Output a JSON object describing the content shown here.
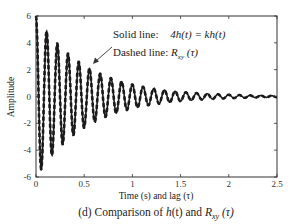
{
  "chart_data": {
    "type": "line",
    "title": "",
    "caption": "(d) Comparison of h(t) and R_xy(τ)",
    "caption_parts": {
      "prefix": "(d) Comparison of ",
      "h": "h",
      "t": "(t)",
      "and": " and ",
      "R": "R",
      "sub": "xy",
      "tau": " (τ)"
    },
    "xlabel": "Time (s) and  lag (τ)",
    "ylabel": "Amplitude",
    "xlim": [
      0,
      2.5
    ],
    "ylim": [
      -6,
      6
    ],
    "xticks": [
      0,
      0.5,
      1,
      1.5,
      2,
      2.5
    ],
    "xtick_labels": [
      "0",
      "0.5",
      "1",
      "1.5",
      "2",
      "2.5"
    ],
    "yticks": [
      -6,
      -4,
      -2,
      0,
      2,
      4,
      6
    ],
    "ytick_labels": [
      "-6",
      "-4",
      "-2",
      "0",
      "2",
      "4",
      "6"
    ],
    "grid": false,
    "annotations": {
      "solid_prefix": "Solid line:",
      "solid_eq": "4h(t) = kh(t)",
      "dashed_prefix": "Dashed line: ",
      "dashed_R": "R",
      "dashed_sub": "xy",
      "dashed_tau": " (τ)"
    },
    "series": [
      {
        "name": "Solid line: 4h(t) = kh(t)",
        "style": "solid",
        "color": "#1a1a1a",
        "model": "A·exp(-d·t)·cos(2π·f·t)",
        "amplitude": 6.0,
        "decay": 1.9,
        "frequency_hz": 9.0
      },
      {
        "name": "Dashed line: R_xy(τ)",
        "style": "dashed",
        "color": "#1a1a1a",
        "model": "A·exp(-d·t)·cos(2π·f·t)",
        "amplitude": 6.0,
        "decay": 1.9,
        "frequency_hz": 9.0
      }
    ],
    "sample_points": {
      "x": [
        0.0,
        0.11,
        0.22,
        0.33,
        0.44,
        0.56,
        0.67,
        0.78,
        1.0,
        1.5,
        2.0,
        2.5
      ],
      "peak_envelope": [
        5.8,
        4.9,
        4.0,
        3.4,
        2.8,
        2.3,
        1.8,
        1.4,
        0.9,
        0.35,
        0.15,
        0.05
      ]
    }
  }
}
